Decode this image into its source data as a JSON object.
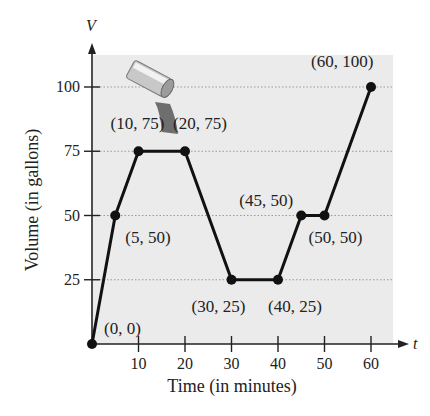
{
  "chart_data": {
    "type": "line",
    "title": "",
    "xlabel": "Time (in minutes)",
    "ylabel": "Volume (in gallons)",
    "x_axis_variable": "t",
    "y_axis_variable": "V",
    "x": [
      0,
      5,
      10,
      20,
      30,
      40,
      45,
      50,
      60
    ],
    "series": [
      {
        "name": "Volume",
        "values": [
          0,
          50,
          75,
          75,
          25,
          25,
          50,
          50,
          100
        ]
      }
    ],
    "xticks": [
      10,
      20,
      30,
      40,
      50,
      60
    ],
    "yticks": [
      25,
      50,
      75,
      100
    ],
    "xlim": [
      0,
      60
    ],
    "ylim": [
      0,
      100
    ],
    "grid": "horizontal dotted",
    "legend": "none",
    "annotations": [
      {
        "text": "(0, 0)",
        "x": 0,
        "y": 0
      },
      {
        "text": "(5, 50)",
        "x": 5,
        "y": 50
      },
      {
        "text": "(10, 75)",
        "x": 10,
        "y": 75
      },
      {
        "text": "(20, 75)",
        "x": 20,
        "y": 75
      },
      {
        "text": "(30, 25)",
        "x": 30,
        "y": 25
      },
      {
        "text": "(40, 25)",
        "x": 40,
        "y": 25
      },
      {
        "text": "(45, 50)",
        "x": 45,
        "y": 50
      },
      {
        "text": "(50, 50)",
        "x": 50,
        "y": 50
      },
      {
        "text": "(60, 100)",
        "x": 60,
        "y": 100
      }
    ],
    "illustration": "pipe pouring water"
  },
  "colors": {
    "plot_background": "#ebebeb",
    "line": "#111111",
    "grid": "#9a9a9a",
    "text": "#222222"
  }
}
